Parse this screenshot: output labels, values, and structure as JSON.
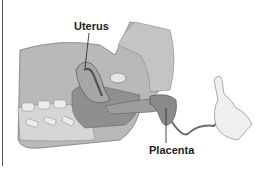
{
  "figure": {
    "labels": {
      "uterus": "Uterus",
      "placenta": "Placenta"
    },
    "colors": {
      "body_fill": "#b9b9b9",
      "body_dark": "#8f8f8f",
      "organ": "#a6a6a6",
      "cavity": "#6f6f6f",
      "light": "#e6e6e6",
      "text": "#222222"
    }
  }
}
